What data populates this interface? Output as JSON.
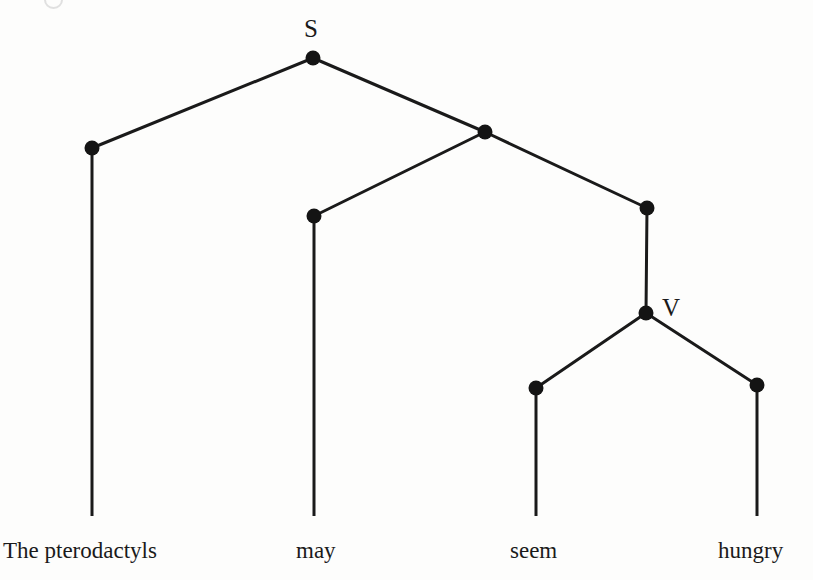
{
  "diagram": {
    "kind": "syntax-tree",
    "sentence": "The pterodactyls may seem hungry",
    "stroke_color": "#1a1a1a",
    "node_color": "#141414",
    "background_color": "#fdfdfc",
    "width": 813,
    "height": 580,
    "node_radius": 7.5,
    "edge_width": 3.0,
    "stem_width": 3.0
  },
  "labels": [
    {
      "id": "label-s",
      "text": "S",
      "x": 304,
      "y": 16,
      "node_id": "n-root"
    },
    {
      "id": "label-v",
      "text": "V",
      "x": 662,
      "y": 295,
      "node_id": "n-v"
    }
  ],
  "nodes": [
    {
      "id": "n-root",
      "name": "root-node-s",
      "label": "S",
      "x": 313,
      "y": 58
    },
    {
      "id": "n-subj",
      "name": "subject-node",
      "label": "",
      "x": 92,
      "y": 148
    },
    {
      "id": "n-pred",
      "name": "predicate-node",
      "label": "",
      "x": 485,
      "y": 132
    },
    {
      "id": "n-aux",
      "name": "auxiliary-node",
      "label": "",
      "x": 314,
      "y": 216
    },
    {
      "id": "n-vp",
      "name": "verb-phrase-node",
      "label": "",
      "x": 647,
      "y": 208
    },
    {
      "id": "n-v",
      "name": "verb-node-v",
      "label": "V",
      "x": 646,
      "y": 313
    },
    {
      "id": "n-seem",
      "name": "seem-node",
      "label": "",
      "x": 536,
      "y": 388
    },
    {
      "id": "n-hungry",
      "name": "hungry-node",
      "label": "",
      "x": 757,
      "y": 385
    }
  ],
  "edges": [
    {
      "id": "e-root-subj",
      "name": "edge-root-to-subject",
      "from": "n-root",
      "x1": 313,
      "y1": 58,
      "x2": 92,
      "y2": 148
    },
    {
      "id": "e-root-pred",
      "name": "edge-root-to-predicate",
      "from": "n-root",
      "x1": 313,
      "y1": 58,
      "x2": 485,
      "y2": 132
    },
    {
      "id": "e-pred-aux",
      "name": "edge-predicate-to-aux",
      "from": "n-pred",
      "x1": 485,
      "y1": 132,
      "x2": 314,
      "y2": 216
    },
    {
      "id": "e-pred-vp",
      "name": "edge-predicate-to-vp",
      "from": "n-pred",
      "x1": 485,
      "y1": 132,
      "x2": 647,
      "y2": 208
    },
    {
      "id": "e-vp-v",
      "name": "edge-vp-to-verb",
      "from": "n-vp",
      "x1": 647,
      "y1": 208,
      "x2": 646,
      "y2": 313
    },
    {
      "id": "e-v-seem",
      "name": "edge-verb-to-seem",
      "from": "n-v",
      "x1": 646,
      "y1": 313,
      "x2": 536,
      "y2": 388
    },
    {
      "id": "e-v-hungry",
      "name": "edge-verb-to-hungry",
      "from": "n-v",
      "x1": 646,
      "y1": 313,
      "x2": 757,
      "y2": 385
    }
  ],
  "stems": [
    {
      "id": "s-subj",
      "name": "stem-to-the-pterodactyls",
      "x": 92,
      "y1": 148,
      "y2": 516
    },
    {
      "id": "s-aux",
      "name": "stem-to-may",
      "x": 314,
      "y1": 216,
      "y2": 516
    },
    {
      "id": "s-seem",
      "name": "stem-to-seem",
      "x": 536,
      "y1": 388,
      "y2": 516
    },
    {
      "id": "s-hungry",
      "name": "stem-to-hungry",
      "x": 757,
      "y1": 385,
      "y2": 516
    }
  ],
  "leaves": [
    {
      "id": "w-subj",
      "name": "leaf-word-the-pterodactyls",
      "text": "The pterodactyls",
      "x": 3,
      "y": 539
    },
    {
      "id": "w-aux",
      "name": "leaf-word-may",
      "text": "may",
      "x": 296,
      "y": 539
    },
    {
      "id": "w-seem",
      "name": "leaf-word-seem",
      "text": "seem",
      "x": 510,
      "y": 539
    },
    {
      "id": "w-hungry",
      "name": "leaf-word-hungry",
      "text": "hungry",
      "x": 718,
      "y": 539
    }
  ]
}
